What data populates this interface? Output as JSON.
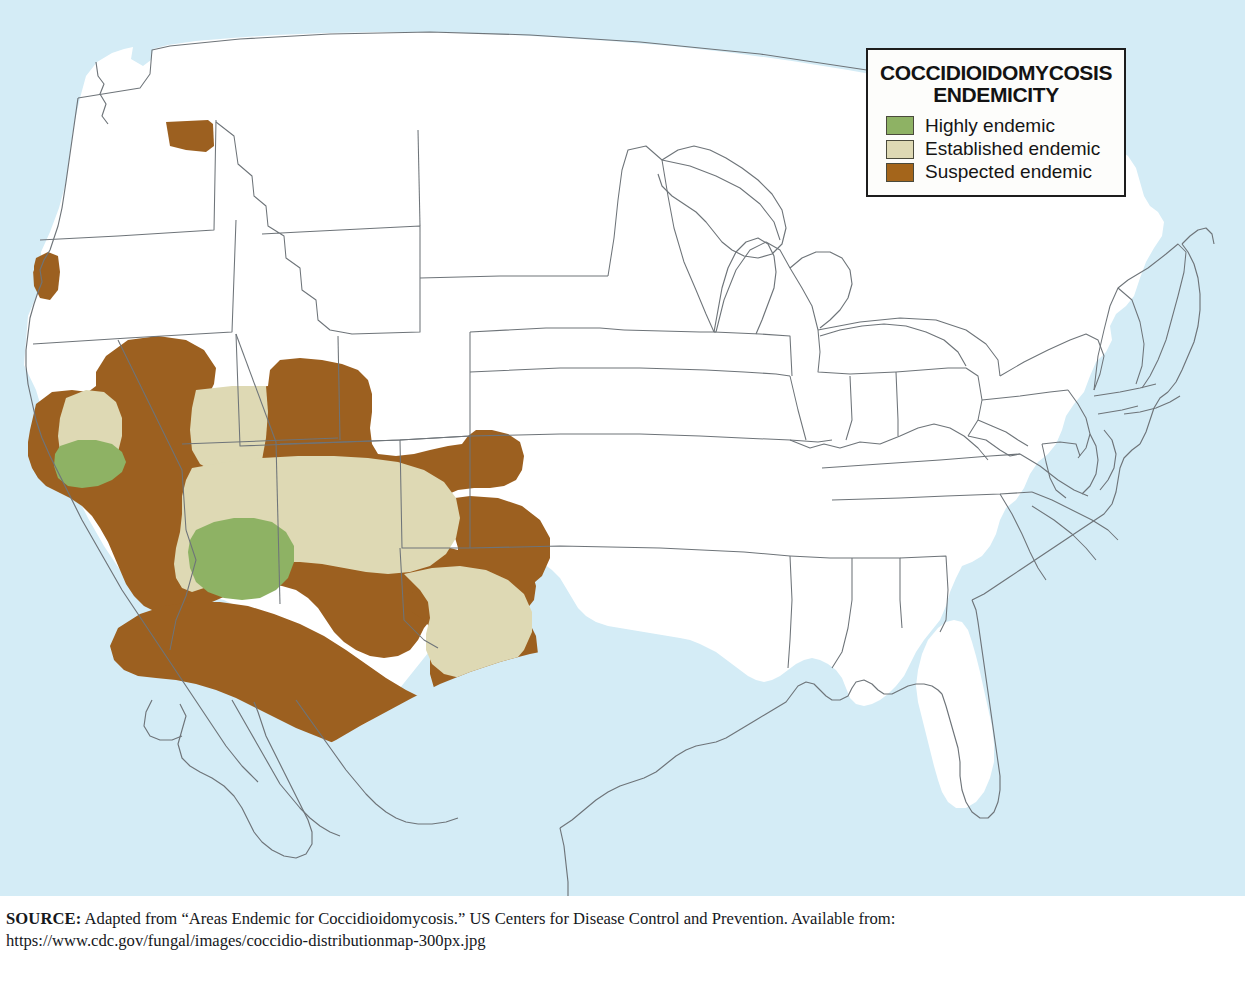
{
  "figure": {
    "kind": "thematic-choropleth-map",
    "region": "United States (contiguous) with northern Mexico outline",
    "background_color": "#d4ecf6",
    "land_color": "#ffffff",
    "border_color": "#6e7479"
  },
  "legend": {
    "title": "COCCIDIOIDOMYCOSIS\nENDEMICITY",
    "title_line_1": "COCCIDIOIDOMYCOSIS",
    "title_line_2": "ENDEMICITY",
    "box_border_color": "#1d1d1d",
    "box_fill": "#fdfdfb",
    "items": [
      {
        "label": "Highly endemic",
        "color": "#8eb264",
        "swatch_name": "highly-endemic-swatch"
      },
      {
        "label": "Established endemic",
        "color": "#ded9b4",
        "swatch_name": "established-endemic-swatch"
      },
      {
        "label": "Suspected endemic",
        "color": "#a4651b",
        "swatch_name": "suspected-endemic-swatch"
      }
    ]
  },
  "source": {
    "label": "SOURCE:",
    "text": " Adapted from “Areas Endemic for Coccidioidomycosis.” US Centers for Disease Control and Prevention. Available from:",
    "url": "https://www.cdc.gov/fungal/images/coccidio-distributionmap-300px.jpg"
  },
  "map_data": {
    "type": "choropleth",
    "classes": [
      "Highly endemic",
      "Established endemic",
      "Suspected endemic"
    ],
    "colors": {
      "highly_endemic": "#8eb264",
      "established_endemic": "#ded9b4",
      "suspected_endemic": "#9c6020",
      "not_endemic": "#ffffff",
      "water": "#d4ecf6"
    },
    "regions": [
      {
        "name": "south-central Washington",
        "class": "Suspected endemic"
      },
      {
        "name": "northern California coast range",
        "class": "Suspected endemic"
      },
      {
        "name": "California Central Valley north",
        "class": "Established endemic"
      },
      {
        "name": "California southern San Joaquin Valley (Kern)",
        "class": "Highly endemic"
      },
      {
        "name": "southern California and Mojave",
        "class": "Suspected endemic"
      },
      {
        "name": "Nevada southern",
        "class": "Suspected endemic"
      },
      {
        "name": "northwestern Utah patch",
        "class": "Suspected endemic"
      },
      {
        "name": "Utah southern",
        "class": "Suspected endemic"
      },
      {
        "name": "Arizona northern plateau",
        "class": "Suspected endemic"
      },
      {
        "name": "Arizona south-central (Maricopa/Pinal/Pima)",
        "class": "Highly endemic"
      },
      {
        "name": "Arizona surrounding counties",
        "class": "Established endemic"
      },
      {
        "name": "New Mexico southern and central",
        "class": "Established endemic"
      },
      {
        "name": "New Mexico border fringe",
        "class": "Suspected endemic"
      },
      {
        "name": "west Texas / Trans-Pecos",
        "class": "Established endemic"
      },
      {
        "name": "Texas border fringe and Rio Grande Valley",
        "class": "Suspected endemic"
      },
      {
        "name": "northern Mexico border states",
        "class": "Suspected endemic"
      },
      {
        "name": "remainder of contiguous United States",
        "class": "Not endemic"
      }
    ]
  }
}
